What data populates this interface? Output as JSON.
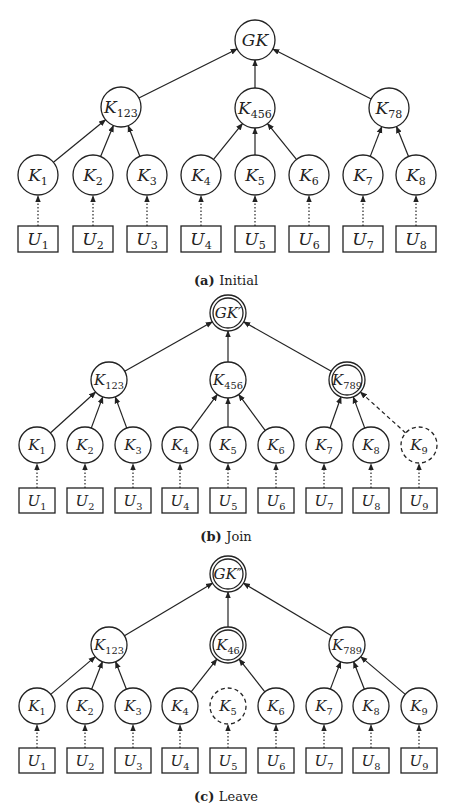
{
  "diagrams": [
    {
      "id": "a",
      "caption_label": "(a)",
      "caption_text": "Initial",
      "caption_y": 285,
      "root": {
        "main": "GK",
        "sub": "",
        "x": 255,
        "y": 40,
        "style": "solid"
      },
      "middle": [
        {
          "main": "K",
          "sub": "123",
          "x": 121,
          "y": 107,
          "style": "solid"
        },
        {
          "main": "K",
          "sub": "456",
          "x": 255,
          "y": 108,
          "style": "solid"
        },
        {
          "main": "K",
          "sub": "78",
          "x": 389,
          "y": 108,
          "style": "solid"
        }
      ],
      "leaves": [
        {
          "main": "K",
          "sub": "1",
          "x": 38,
          "parent": 0,
          "style": "solid",
          "user": "U",
          "user_sub": "1"
        },
        {
          "main": "K",
          "sub": "2",
          "x": 93,
          "parent": 0,
          "style": "solid",
          "user": "U",
          "user_sub": "2"
        },
        {
          "main": "K",
          "sub": "3",
          "x": 147,
          "parent": 0,
          "style": "solid",
          "user": "U",
          "user_sub": "3"
        },
        {
          "main": "K",
          "sub": "4",
          "x": 201,
          "parent": 1,
          "style": "solid",
          "user": "U",
          "user_sub": "4"
        },
        {
          "main": "K",
          "sub": "5",
          "x": 255,
          "parent": 1,
          "style": "solid",
          "user": "U",
          "user_sub": "5"
        },
        {
          "main": "K",
          "sub": "6",
          "x": 309,
          "parent": 1,
          "style": "solid",
          "user": "U",
          "user_sub": "6"
        },
        {
          "main": "K",
          "sub": "7",
          "x": 363,
          "parent": 2,
          "style": "solid",
          "user": "U",
          "user_sub": "7"
        },
        {
          "main": "K",
          "sub": "8",
          "x": 416,
          "parent": 2,
          "style": "solid",
          "user": "U",
          "user_sub": "8"
        }
      ],
      "leaf_y": 175,
      "user_y": 226,
      "radius": 20
    },
    {
      "id": "b",
      "caption_label": "(b)",
      "caption_text": "Join",
      "caption_y": 541,
      "root": {
        "main": "GK′",
        "sub": "",
        "x": 228,
        "y": 313,
        "style": "double"
      },
      "middle": [
        {
          "main": "K",
          "sub": "123",
          "x": 109,
          "y": 380,
          "style": "solid"
        },
        {
          "main": "K",
          "sub": "456",
          "x": 228,
          "y": 380,
          "style": "solid"
        },
        {
          "main": "K",
          "sub": "789",
          "x": 347,
          "y": 380,
          "style": "double"
        }
      ],
      "leaves": [
        {
          "main": "K",
          "sub": "1",
          "x": 37,
          "parent": 0,
          "style": "solid",
          "user": "U",
          "user_sub": "1"
        },
        {
          "main": "K",
          "sub": "2",
          "x": 85,
          "parent": 0,
          "style": "solid",
          "user": "U",
          "user_sub": "2"
        },
        {
          "main": "K",
          "sub": "3",
          "x": 133,
          "parent": 0,
          "style": "solid",
          "user": "U",
          "user_sub": "3"
        },
        {
          "main": "K",
          "sub": "4",
          "x": 180,
          "parent": 1,
          "style": "solid",
          "user": "U",
          "user_sub": "4"
        },
        {
          "main": "K",
          "sub": "5",
          "x": 228,
          "parent": 1,
          "style": "solid",
          "user": "U",
          "user_sub": "5"
        },
        {
          "main": "K",
          "sub": "6",
          "x": 276,
          "parent": 1,
          "style": "solid",
          "user": "U",
          "user_sub": "6"
        },
        {
          "main": "K",
          "sub": "7",
          "x": 324,
          "parent": 2,
          "style": "solid",
          "user": "U",
          "user_sub": "7"
        },
        {
          "main": "K",
          "sub": "8",
          "x": 371,
          "parent": 2,
          "style": "solid",
          "user": "U",
          "user_sub": "8"
        },
        {
          "main": "K",
          "sub": "9",
          "x": 419,
          "parent": 2,
          "style": "dashed",
          "user": "U",
          "user_sub": "9"
        }
      ],
      "leaf_y": 445,
      "user_y": 488,
      "radius": 18
    },
    {
      "id": "c",
      "caption_label": "(c)",
      "caption_text": "Leave",
      "caption_y": 801,
      "root": {
        "main": "GK″",
        "sub": "",
        "x": 228,
        "y": 574,
        "style": "double"
      },
      "middle": [
        {
          "main": "K",
          "sub": "123",
          "x": 109,
          "y": 645,
          "style": "solid"
        },
        {
          "main": "K",
          "sub": "46",
          "x": 228,
          "y": 645,
          "style": "double"
        },
        {
          "main": "K",
          "sub": "789",
          "x": 347,
          "y": 645,
          "style": "solid"
        }
      ],
      "leaves": [
        {
          "main": "K",
          "sub": "1",
          "x": 37,
          "parent": 0,
          "style": "solid",
          "user": "U",
          "user_sub": "1"
        },
        {
          "main": "K",
          "sub": "2",
          "x": 85,
          "parent": 0,
          "style": "solid",
          "user": "U",
          "user_sub": "2"
        },
        {
          "main": "K",
          "sub": "3",
          "x": 133,
          "parent": 0,
          "style": "solid",
          "user": "U",
          "user_sub": "3"
        },
        {
          "main": "K",
          "sub": "4",
          "x": 180,
          "parent": 1,
          "style": "solid",
          "user": "U",
          "user_sub": "4"
        },
        {
          "main": "K",
          "sub": "5",
          "x": 228,
          "parent": -1,
          "style": "dashed",
          "user": "U",
          "user_sub": "5"
        },
        {
          "main": "K",
          "sub": "6",
          "x": 276,
          "parent": 1,
          "style": "solid",
          "user": "U",
          "user_sub": "6"
        },
        {
          "main": "K",
          "sub": "7",
          "x": 324,
          "parent": 2,
          "style": "solid",
          "user": "U",
          "user_sub": "7"
        },
        {
          "main": "K",
          "sub": "8",
          "x": 371,
          "parent": 2,
          "style": "solid",
          "user": "U",
          "user_sub": "8"
        },
        {
          "main": "K",
          "sub": "9",
          "x": 419,
          "parent": 2,
          "style": "solid",
          "user": "U",
          "user_sub": "9"
        }
      ],
      "leaf_y": 706,
      "user_y": 748,
      "radius": 18
    }
  ],
  "colors": {
    "stroke": "#222222",
    "background": "#ffffff"
  }
}
